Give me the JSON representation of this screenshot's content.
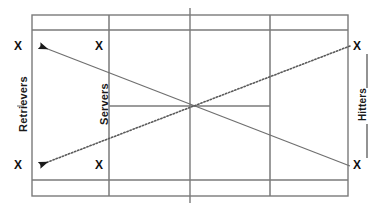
{
  "diagram": {
    "court": {
      "surface_color": "#ffffff",
      "line_color": "#7a7a7a",
      "outer": {
        "x": 32,
        "y": 15,
        "width": 316,
        "height": 181
      },
      "singles_top_y": 30,
      "singles_bottom_y": 180,
      "service_line_left_x": 109,
      "service_line_right_x": 270,
      "net_x": 190,
      "center_service_y": 106
    },
    "groups": [
      {
        "id": "retrievers",
        "label": "Retrievers",
        "side": "left",
        "orientation": "vertical"
      },
      {
        "id": "servers",
        "label": "Servers",
        "side": "left-inner",
        "orientation": "vertical"
      },
      {
        "id": "hitters",
        "label": "Hitters",
        "side": "right",
        "orientation": "vertical",
        "has_bracket": true
      }
    ],
    "player_marks": [
      {
        "id": "retriever-top",
        "glyph": "X",
        "x": 18,
        "y": 46,
        "group": "retrievers"
      },
      {
        "id": "retriever-bottom",
        "glyph": "X",
        "x": 18,
        "y": 165,
        "group": "retrievers"
      },
      {
        "id": "server-top",
        "glyph": "X",
        "x": 99,
        "y": 46,
        "group": "servers"
      },
      {
        "id": "server-bottom",
        "glyph": "X",
        "x": 99,
        "y": 165,
        "group": "servers"
      },
      {
        "id": "hitter-top",
        "glyph": "X",
        "x": 357,
        "y": 46,
        "group": "hitters"
      },
      {
        "id": "hitter-bottom",
        "glyph": "X",
        "x": 357,
        "y": 165,
        "group": "hitters"
      }
    ],
    "ball_paths": [
      {
        "id": "path-solid",
        "style": "solid",
        "color": "#6f6f6f",
        "from": {
          "x": 350,
          "y": 166
        },
        "to": {
          "x": 36,
          "y": 45
        },
        "arrowhead": "start-to-end-at-retriever-top"
      },
      {
        "id": "path-dotted",
        "style": "dotted",
        "color": "#5a5a5a",
        "from": {
          "x": 350,
          "y": 45
        },
        "to": {
          "x": 36,
          "y": 166
        },
        "arrowhead": "start-to-end-at-retriever-bottom"
      }
    ],
    "bracket": {
      "color": "#3a3a3a",
      "top_segment": {
        "x": 367,
        "y1": 54,
        "y2": 88
      },
      "bottom_segment": {
        "x": 367,
        "y1": 124,
        "y2": 158
      }
    }
  }
}
